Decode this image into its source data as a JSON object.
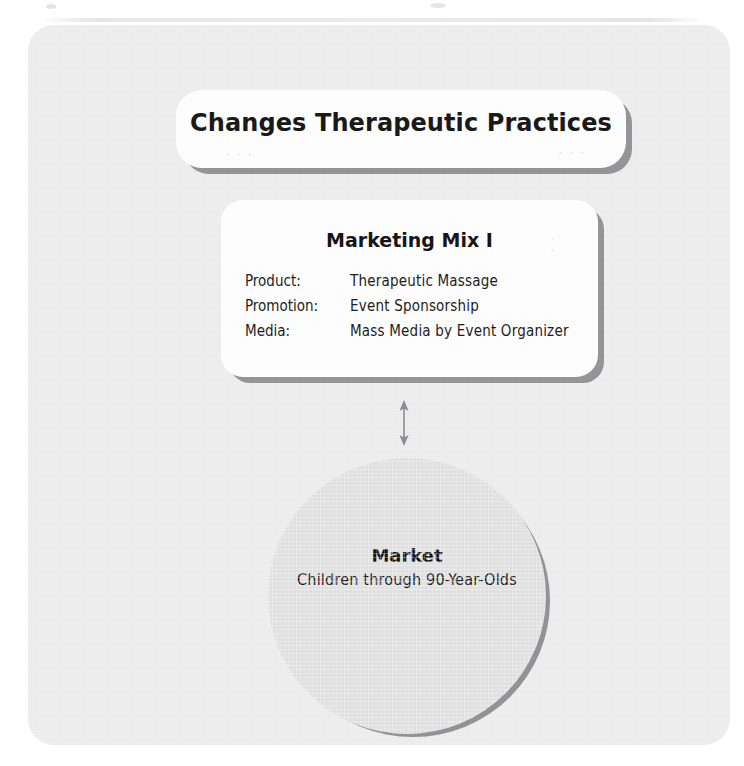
{
  "diagram": {
    "title_card": {
      "title": "Changes Therapeutic Practices"
    },
    "marketing_mix_card": {
      "heading": "Marketing Mix I",
      "rows": [
        {
          "label": "Product:",
          "value": "Therapeutic Massage"
        },
        {
          "label": "Promotion:",
          "value": "Event Sponsorship"
        },
        {
          "label": "Media:",
          "value": "Mass Media by Event Organizer"
        }
      ]
    },
    "connector": {
      "kind": "double-headed-vertical-arrow"
    },
    "market_circle": {
      "title": "Market",
      "subtitle": "Children through 90-Year-Olds"
    },
    "colors": {
      "panel_background": "#efefef",
      "card_background": "#ffffff",
      "circle_fill": "#e2e2e2",
      "shadow": "#7d7d82",
      "text": "#1a1a1a"
    }
  }
}
